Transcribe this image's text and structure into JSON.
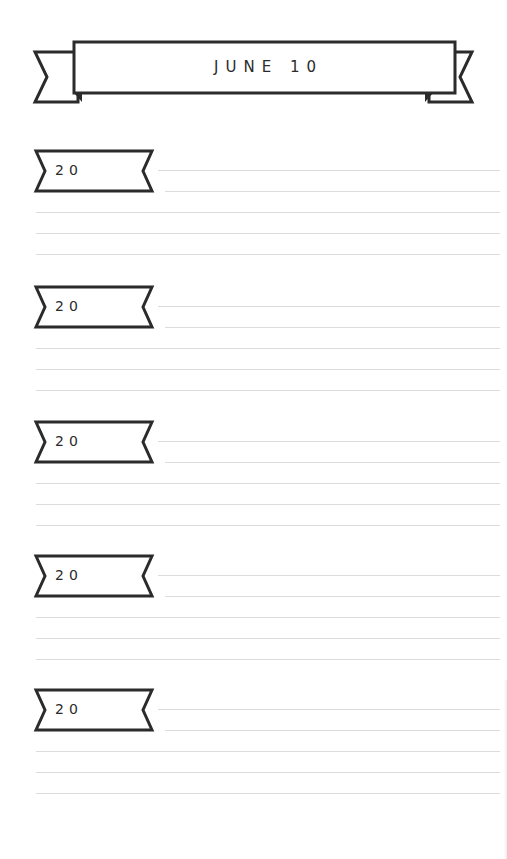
{
  "page": {
    "title": "JUNE 10",
    "entries": [
      {
        "year_prefix": "20"
      },
      {
        "year_prefix": "20"
      },
      {
        "year_prefix": "20"
      },
      {
        "year_prefix": "20"
      },
      {
        "year_prefix": "20"
      }
    ]
  },
  "colors": {
    "ink": "#2b2b2b",
    "rule": "#dcdcdc",
    "paper": "#ffffff"
  }
}
